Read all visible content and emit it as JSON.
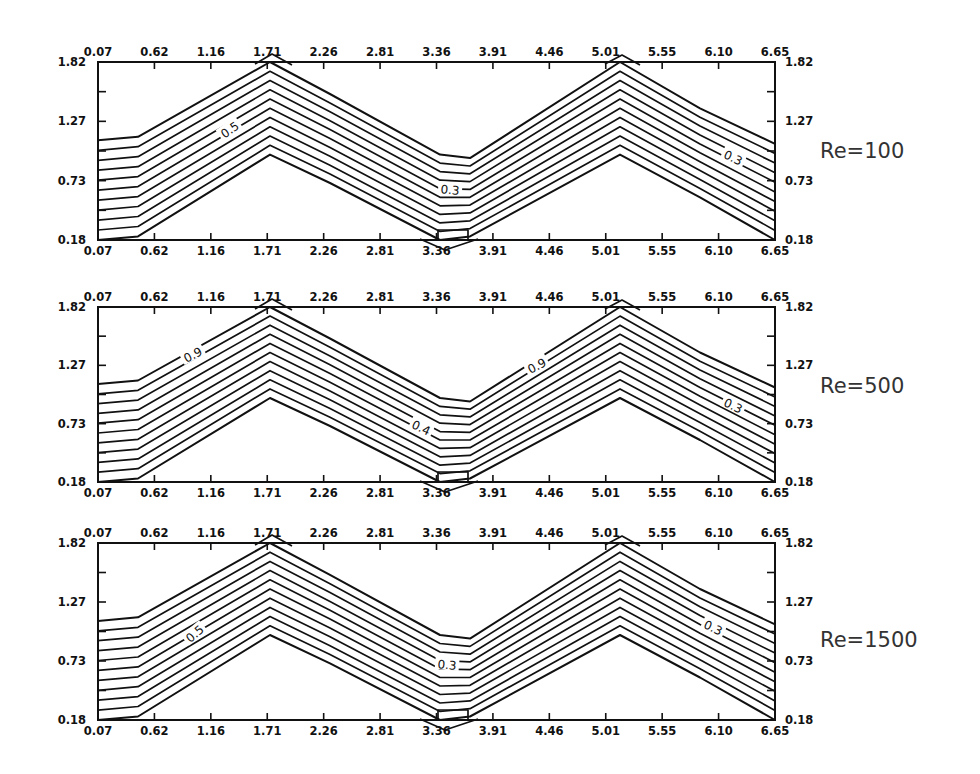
{
  "chart_data": [
    {
      "type": "contour",
      "title": "Re=100",
      "x_ticks": [
        "0.07",
        "0.62",
        "1.16",
        "1.71",
        "2.26",
        "2.81",
        "3.36",
        "3.91",
        "4.46",
        "5.01",
        "5.55",
        "6.10",
        "6.65"
      ],
      "y_ticks": [
        "0.18",
        "0.73",
        "1.27",
        "1.82"
      ],
      "xlim": [
        0.07,
        6.65
      ],
      "ylim": [
        0.18,
        1.82
      ],
      "contour_labels": [
        "0.5",
        "0.5",
        "0.5"
      ],
      "contour_levels_count": 10,
      "annotation": "Re=100",
      "grid": false
    },
    {
      "type": "contour",
      "title": "Re=500",
      "x_ticks": [
        "0.07",
        "0.62",
        "1.16",
        "1.71",
        "2.26",
        "2.81",
        "3.36",
        "3.91",
        "4.46",
        "5.01",
        "5.55",
        "6.10",
        "6.65"
      ],
      "y_ticks": [
        "0.18",
        "0.73",
        "1.27",
        "1.82"
      ],
      "xlim": [
        0.07,
        6.65
      ],
      "ylim": [
        0.18,
        1.82
      ],
      "contour_labels": [
        "0.9",
        "0.4",
        "0.9",
        "0.3"
      ],
      "contour_levels_count": 10,
      "annotation": "Re=500",
      "grid": false
    },
    {
      "type": "contour",
      "title": "Re=1500",
      "x_ticks": [
        "0.07",
        "0.62",
        "1.16",
        "1.71",
        "2.26",
        "2.81",
        "3.36",
        "3.91",
        "4.46",
        "5.01",
        "5.55",
        "6.10",
        "6.65"
      ],
      "y_ticks": [
        "0.18",
        "0.73",
        "1.27",
        "1.82"
      ],
      "xlim": [
        0.07,
        6.65
      ],
      "ylim": [
        0.18,
        1.82
      ],
      "contour_labels": [
        "0.5",
        "0.5",
        "0.5"
      ],
      "contour_levels_count": 10,
      "annotation": "Re=1500",
      "grid": false
    }
  ],
  "panels": [
    {
      "re_label": "Re=100",
      "x_ticks": [
        "0.07",
        "0.62",
        "1.16",
        "1.71",
        "2.26",
        "2.81",
        "3.36",
        "3.91",
        "4.46",
        "5.01",
        "5.55",
        "6.10",
        "6.65"
      ],
      "y_ticks_left": [
        "1.82",
        "1.27",
        "0.73",
        "0.18"
      ],
      "y_ticks_right": [
        "1.82",
        "1.27",
        "0.73",
        "0.18"
      ],
      "labels": [
        {
          "text": "0.5",
          "x": 230,
          "y": 130,
          "rot": -35
        },
        {
          "text": "0.3",
          "x": 450,
          "y": 190,
          "rot": 5
        },
        {
          "text": "0.3",
          "x": 733,
          "y": 158,
          "rot": 25
        }
      ]
    },
    {
      "re_label": "Re=500",
      "x_ticks": [
        "0.07",
        "0.62",
        "1.16",
        "1.71",
        "2.26",
        "2.81",
        "3.36",
        "3.91",
        "4.46",
        "5.01",
        "5.55",
        "6.10",
        "6.65"
      ],
      "y_ticks_left": [
        "1.82",
        "1.27",
        "0.73",
        "0.18"
      ],
      "y_ticks_right": [
        "1.82",
        "1.27",
        "0.73",
        "0.18"
      ],
      "labels": [
        {
          "text": "0.9",
          "x": 193,
          "y": 355,
          "rot": -28
        },
        {
          "text": "0.4",
          "x": 421,
          "y": 428,
          "rot": 25
        },
        {
          "text": "0.9",
          "x": 537,
          "y": 366,
          "rot": -28
        },
        {
          "text": "0.3",
          "x": 733,
          "y": 406,
          "rot": 25
        }
      ]
    },
    {
      "re_label": "Re=1500",
      "x_ticks": [
        "0.07",
        "0.62",
        "1.16",
        "1.71",
        "2.26",
        "2.81",
        "3.36",
        "3.91",
        "4.46",
        "5.01",
        "5.55",
        "6.10",
        "6.65"
      ],
      "y_ticks_left": [
        "1.82",
        "1.27",
        "0.73",
        "0.18"
      ],
      "y_ticks_right": [
        "1.82",
        "1.27",
        "0.73",
        "0.18"
      ],
      "labels": [
        {
          "text": "0.5",
          "x": 195,
          "y": 634,
          "rot": -40
        },
        {
          "text": "0.3",
          "x": 447,
          "y": 665,
          "rot": 5
        },
        {
          "text": "0.3",
          "x": 713,
          "y": 628,
          "rot": 25
        }
      ]
    }
  ]
}
